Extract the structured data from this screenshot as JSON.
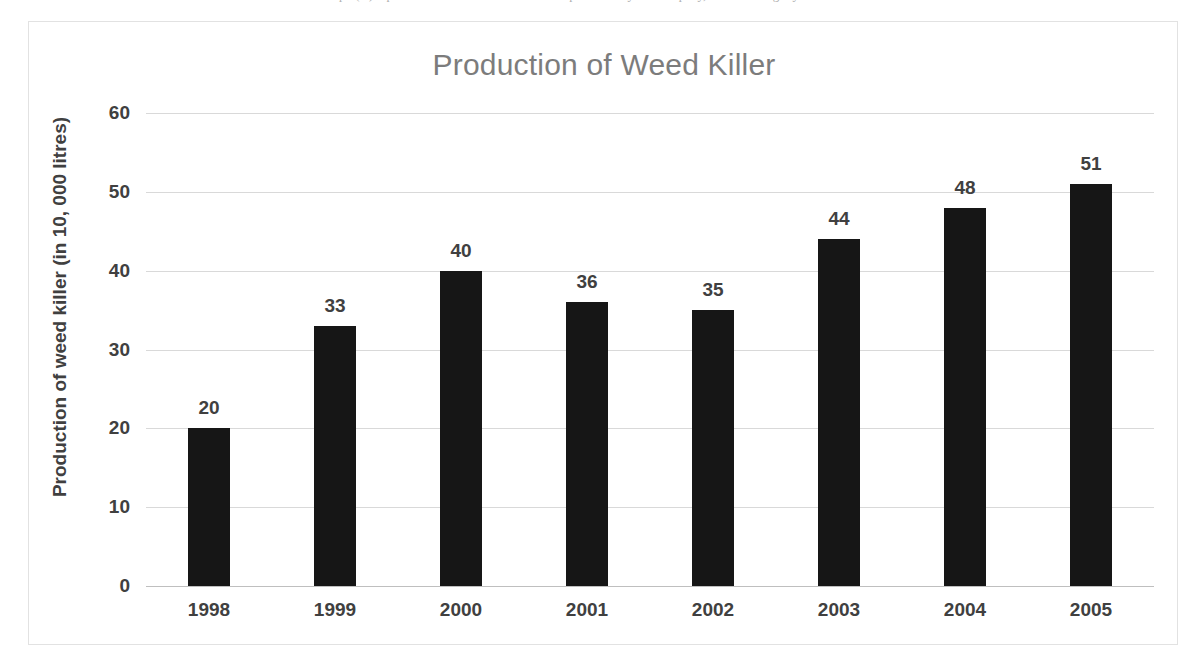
{
  "page": {
    "top_clipped_text": "Graph (A) represents the amount of weed killer produced by the company, in the last eight years since 2005."
  },
  "chart_data": {
    "type": "bar",
    "title": "Production of Weed Killer",
    "xlabel": "",
    "ylabel": "Production of weed killer (in 10, 000 litres)",
    "categories": [
      "1998",
      "1999",
      "2000",
      "2001",
      "2002",
      "2003",
      "2004",
      "2005"
    ],
    "values": [
      20,
      33,
      40,
      36,
      35,
      44,
      48,
      51
    ],
    "ylim": [
      0,
      60
    ],
    "yticks": [
      0,
      10,
      20,
      30,
      40,
      50,
      60
    ],
    "ytick_labels": [
      "0",
      "10",
      "20",
      "30",
      "40",
      "50",
      "60"
    ],
    "data_labels": [
      "20",
      "33",
      "40",
      "36",
      "35",
      "44",
      "48",
      "51"
    ],
    "grid": true,
    "legend": false,
    "bar_color": "#161616",
    "gridline_color": "#d9d9d9",
    "title_color": "#7c7c7c",
    "label_color": "#404040",
    "plot_background": "#ffffff"
  }
}
